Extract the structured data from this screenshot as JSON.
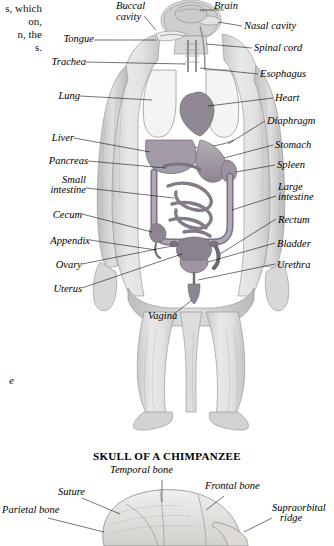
{
  "margin_text": {
    "lines": [
      "s, which",
      "on,",
      "n, the",
      "s."
    ],
    "italic_fragment": "e"
  },
  "figure": {
    "caption_alt": "Internal organs of a chimpanzee, anterior view",
    "labels_left": [
      {
        "text": "Tongue",
        "x": 12,
        "y": 37
      },
      {
        "text": "Trachea",
        "x": 2,
        "y": 60
      },
      {
        "text": "Lung",
        "x": 0,
        "y": 94
      },
      {
        "text": "Liver",
        "x": 0,
        "y": 135
      },
      {
        "text": "Pancreas",
        "x": 0,
        "y": 159
      },
      {
        "text": "Small",
        "x": 8,
        "y": 178
      },
      {
        "text": "intestine",
        "x": 0,
        "y": 188
      },
      {
        "text": "Cecum",
        "x": 0,
        "y": 212
      },
      {
        "text": "Appendix",
        "x": 0,
        "y": 238
      },
      {
        "text": "Ovary",
        "x": 0,
        "y": 262
      },
      {
        "text": "Uterus",
        "x": 0,
        "y": 285
      }
    ],
    "labels_top": [
      {
        "text": "Buccal",
        "x": 68,
        "y": 2
      },
      {
        "text": "cavity",
        "x": 70,
        "y": 12
      },
      {
        "text": "Brain",
        "x": 166,
        "y": 2
      }
    ],
    "labels_right": [
      {
        "text": "Nasal cavity",
        "x": 196,
        "y": 24
      },
      {
        "text": "Spinal cord",
        "x": 206,
        "y": 46
      },
      {
        "text": "Esophagus",
        "x": 212,
        "y": 72
      },
      {
        "text": "Heart",
        "x": 227,
        "y": 96
      },
      {
        "text": "Diaphragm",
        "x": 219,
        "y": 119
      },
      {
        "text": "Stomach",
        "x": 227,
        "y": 143
      },
      {
        "text": "Spleen",
        "x": 229,
        "y": 163
      },
      {
        "text": "Large",
        "x": 230,
        "y": 184
      },
      {
        "text": "intestine",
        "x": 230,
        "y": 194
      },
      {
        "text": "Rectum",
        "x": 230,
        "y": 217
      },
      {
        "text": "Bladder",
        "x": 229,
        "y": 241
      },
      {
        "text": "Urethra",
        "x": 229,
        "y": 262
      }
    ],
    "label_center": {
      "text": "Vagina",
      "x": 100,
      "y": 313
    }
  },
  "skull": {
    "title": "SKULL OF A CHIMPANZEE",
    "labels": [
      {
        "text": "Temporal bone",
        "x": 110,
        "y": 0
      },
      {
        "text": "Frontal bone",
        "x": 205,
        "y": 16
      },
      {
        "text": "Suture",
        "x": 58,
        "y": 22
      },
      {
        "text": "Parietal bone",
        "x": 2,
        "y": 40
      },
      {
        "text": "Supraorbital",
        "x": 272,
        "y": 38
      },
      {
        "text": "ridge",
        "x": 280,
        "y": 48
      }
    ]
  }
}
